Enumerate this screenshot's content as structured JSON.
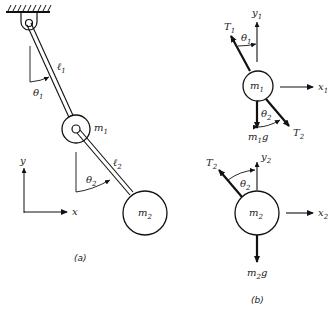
{
  "figure": {
    "panel_a": {
      "caption": "(a)",
      "labels": {
        "l1": "ℓ",
        "l1_sub": "1",
        "l2": "ℓ",
        "l2_sub": "2",
        "theta1": "θ",
        "theta1_sub": "1",
        "theta2": "θ",
        "theta2_sub": "2",
        "m1": "m",
        "m1_sub": "1",
        "m2": "m",
        "m2_sub": "2",
        "axis_x": "x",
        "axis_y": "y"
      }
    },
    "panel_b": {
      "caption": "(b)",
      "labels": {
        "T1": "T",
        "T1_sub": "1",
        "y1": "y",
        "y1_sub": "1",
        "x1": "x",
        "x1_sub": "1",
        "theta1": "θ",
        "theta1_sub": "1",
        "m1": "m",
        "m1_sub": "1",
        "theta2": "θ",
        "theta2_sub": "2",
        "m1g": "m",
        "m1g_sub": "1",
        "m1g_g": "g",
        "T2_top": "T",
        "T2_top_sub": "2",
        "T2": "T",
        "T2_sub": "2",
        "y2": "y",
        "y2_sub": "2",
        "theta2_b": "θ",
        "theta2_b_sub": "2",
        "m2": "m",
        "m2_sub": "2",
        "x2": "x",
        "x2_sub": "2",
        "m2g": "m",
        "m2g_sub": "2",
        "m2g_g": "g"
      }
    }
  }
}
